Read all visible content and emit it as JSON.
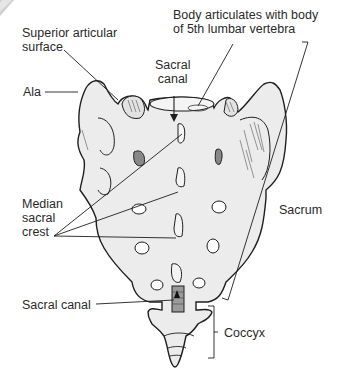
{
  "diagram": {
    "colors": {
      "bone_fill": "#ececec",
      "outline": "#1e1e1e",
      "hatch": "#555555",
      "canal_fill": "#9a9a9a",
      "background": "#ffffff"
    },
    "labels": {
      "superior_articular_line1": "Superior articular",
      "superior_articular_line2": "surface",
      "body_articulates_line1": "Body articulates with body",
      "body_articulates_line2": "of 5th lumbar vertebra",
      "sacral_canal_top_line1": "Sacral",
      "sacral_canal_top_line2": "canal",
      "ala": "Ala",
      "median_line1": "Median",
      "median_line2": "sacral",
      "median_line3": "crest",
      "sacrum": "Sacrum",
      "sacral_canal_bottom": "Sacral canal",
      "coccyx": "Coccyx"
    }
  }
}
